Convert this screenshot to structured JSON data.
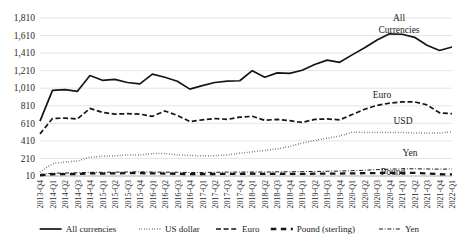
{
  "chart_data": {
    "type": "line",
    "title": "",
    "xlabel": "",
    "ylabel": "",
    "ylim": [
      10,
      1810
    ],
    "ytick_values": [
      10,
      210,
      410,
      610,
      810,
      1010,
      1210,
      1410,
      1610,
      1810
    ],
    "ytick_labels": [
      "10",
      "210",
      "410",
      "610",
      "810",
      "1,010",
      "1,210",
      "1,410",
      "1,610",
      "1,810"
    ],
    "grid": true,
    "legend_position": "bottom",
    "categories": [
      "2013-Q4",
      "2014-Q1",
      "2014-Q2",
      "2014-Q3",
      "2014-Q4",
      "2015-Q1",
      "2015-Q2",
      "2015-Q3",
      "2015-Q4",
      "2016-Q1",
      "2016-Q2",
      "2016-Q3",
      "2016-Q4",
      "2017-Q1",
      "2017-Q2",
      "2017-Q3",
      "2017-Q4",
      "2018-Q1",
      "2018-Q2",
      "2018-Q3",
      "2018-Q4",
      "2019-Q1",
      "2019-Q2",
      "2019-Q3",
      "2019-Q4",
      "2020-Q1",
      "2020-Q2",
      "2020-Q3",
      "2020-Q4",
      "2021-Q1",
      "2021-Q2",
      "2021-Q3",
      "2021-Q4",
      "2022-Q1"
    ],
    "series": [
      {
        "name": "All currencies",
        "style": "solid",
        "values": [
          635,
          985,
          995,
          975,
          1155,
          1100,
          1110,
          1075,
          1060,
          1170,
          1135,
          1090,
          1000,
          1040,
          1075,
          1090,
          1095,
          1210,
          1135,
          1185,
          1180,
          1215,
          1280,
          1330,
          1305,
          1390,
          1470,
          1560,
          1630,
          1625,
          1590,
          1500,
          1440,
          1480
        ]
      },
      {
        "name": "US dollar",
        "style": "dotted",
        "values": [
          55,
          150,
          170,
          180,
          225,
          235,
          240,
          250,
          250,
          265,
          265,
          250,
          245,
          240,
          240,
          250,
          270,
          285,
          300,
          320,
          345,
          385,
          415,
          440,
          465,
          510,
          505,
          505,
          505,
          505,
          500,
          500,
          500,
          515
        ]
      },
      {
        "name": "Euro",
        "style": "dashed",
        "values": [
          490,
          665,
          670,
          660,
          780,
          735,
          715,
          720,
          715,
          690,
          750,
          700,
          630,
          650,
          665,
          655,
          680,
          690,
          645,
          655,
          640,
          620,
          655,
          660,
          650,
          710,
          770,
          815,
          840,
          855,
          855,
          820,
          730,
          720
        ]
      },
      {
        "name": "Pound (sterling)",
        "style": "longdash",
        "values": [
          18,
          30,
          32,
          33,
          40,
          38,
          40,
          42,
          42,
          40,
          38,
          35,
          32,
          32,
          33,
          34,
          35,
          36,
          34,
          36,
          35,
          34,
          36,
          38,
          38,
          40,
          42,
          44,
          46,
          46,
          45,
          40,
          30,
          28
        ]
      },
      {
        "name": "Yen",
        "style": "dashdot",
        "values": [
          28,
          42,
          44,
          46,
          52,
          52,
          54,
          56,
          58,
          55,
          54,
          52,
          50,
          50,
          52,
          54,
          55,
          56,
          55,
          58,
          58,
          60,
          62,
          64,
          66,
          70,
          76,
          82,
          88,
          92,
          92,
          90,
          88,
          90
        ]
      }
    ],
    "annotations": [
      {
        "text": "All",
        "series": "All currencies",
        "x_px": 399,
        "y_px": 21
      },
      {
        "text": "Currencies",
        "series": "All currencies",
        "x_px": 399,
        "y_px": 33
      },
      {
        "text": "Euro",
        "series": "Euro",
        "x_px": 382,
        "y_px": 98
      },
      {
        "text": "USD",
        "series": "US dollar",
        "x_px": 403,
        "y_px": 124
      },
      {
        "text": "Yen",
        "series": "Yen",
        "x_px": 410,
        "y_px": 156
      },
      {
        "text": "Pound",
        "series": "Pound (sterling)",
        "x_px": 393,
        "y_px": 175
      }
    ]
  },
  "legend": {
    "items": [
      {
        "label": "All currencies",
        "style": "solid"
      },
      {
        "label": "US dollar",
        "style": "dotted"
      },
      {
        "label": "Euro",
        "style": "dashed"
      },
      {
        "label": "Pound (sterling)",
        "style": "longdash"
      },
      {
        "label": "Yen",
        "style": "dashdot"
      }
    ]
  },
  "colors": {
    "line": "#151515",
    "grid": "#d9d9d9",
    "axis": "#9a9a9a",
    "text": "#2b2b2b",
    "background": "#ffffff"
  }
}
